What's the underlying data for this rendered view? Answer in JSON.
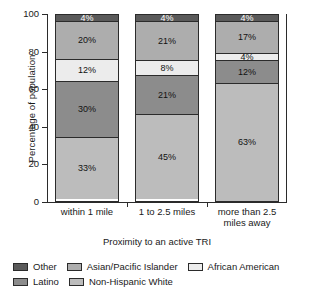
{
  "chart_data": {
    "type": "bar",
    "subtype": "stacked-bar-100-percent",
    "title": "",
    "xlabel": "Proximity to an active TRI",
    "ylabel": "Percentage of population",
    "ylim": [
      0,
      100
    ],
    "yticks": [
      0,
      20,
      40,
      60,
      80,
      100
    ],
    "ytick_labels": [
      "0",
      "20",
      "40",
      "60",
      "80",
      "100"
    ],
    "grid": false,
    "legend_position": "bottom",
    "categories": [
      "within 1 mile",
      "1 to 2.5 miles",
      "more than 2.5 miles away"
    ],
    "stack_order_bottom_to_top": [
      "Non-Hispanic White",
      "Latino",
      "African American",
      "Asian/Pacific Islander",
      "Other"
    ],
    "series": [
      {
        "name": "Non-Hispanic White",
        "color": "#bcbcbc",
        "values": [
          33,
          45,
          63
        ],
        "labels": [
          "33%",
          "45%",
          "63%"
        ]
      },
      {
        "name": "Latino",
        "color": "#8c8c8c",
        "values": [
          30,
          21,
          12
        ],
        "labels": [
          "30%",
          "21%",
          "12%"
        ]
      },
      {
        "name": "African American",
        "color": "#ececec",
        "values": [
          12,
          8,
          4
        ],
        "labels": [
          "12%",
          "8%",
          "4%"
        ]
      },
      {
        "name": "Asian/Pacific Islander",
        "color": "#adadad",
        "values": [
          20,
          21,
          17
        ],
        "labels": [
          "20%",
          "21%",
          "17%"
        ]
      },
      {
        "name": "Other",
        "color": "#5a5a5a",
        "values": [
          4,
          4,
          4
        ],
        "labels": [
          "4%",
          "4%",
          "4%"
        ]
      }
    ],
    "legend_entries": [
      {
        "label": "Other",
        "color": "#5a5a5a"
      },
      {
        "label": "Asian/Pacific Islander",
        "color": "#adadad"
      },
      {
        "label": "African American",
        "color": "#ececec"
      },
      {
        "label": "Latino",
        "color": "#8c8c8c"
      },
      {
        "label": "Non-Hispanic White",
        "color": "#bcbcbc"
      }
    ]
  },
  "axes": {
    "y_title": "Percentage of population",
    "x_title": "Proximity to an active TRI",
    "y_ticks": [
      "100",
      "80",
      "60",
      "40",
      "20",
      "0"
    ],
    "x_tick_labels": [
      {
        "line1": "within 1 mile",
        "line2": ""
      },
      {
        "line1": "1 to 2.5 miles",
        "line2": ""
      },
      {
        "line1": "more than 2.5",
        "line2": "miles away"
      }
    ]
  },
  "bars": [
    {
      "name": "within 1 mile",
      "segments": [
        {
          "label": "4%",
          "value": 4,
          "series": "Other"
        },
        {
          "label": "20%",
          "value": 20,
          "series": "Asian/Pacific Islander"
        },
        {
          "label": "12%",
          "value": 12,
          "series": "African American"
        },
        {
          "label": "30%",
          "value": 30,
          "series": "Latino"
        },
        {
          "label": "33%",
          "value": 33,
          "series": "Non-Hispanic White"
        }
      ]
    },
    {
      "name": "1 to 2.5 miles",
      "segments": [
        {
          "label": "4%",
          "value": 4,
          "series": "Other"
        },
        {
          "label": "21%",
          "value": 21,
          "series": "Asian/Pacific Islander"
        },
        {
          "label": "8%",
          "value": 8,
          "series": "African American"
        },
        {
          "label": "21%",
          "value": 21,
          "series": "Latino"
        },
        {
          "label": "45%",
          "value": 45,
          "series": "Non-Hispanic White"
        }
      ]
    },
    {
      "name": "more than 2.5 miles away",
      "segments": [
        {
          "label": "4%",
          "value": 4,
          "series": "Other"
        },
        {
          "label": "17%",
          "value": 17,
          "series": "Asian/Pacific Islander"
        },
        {
          "label": "4%",
          "value": 4,
          "series": "African American"
        },
        {
          "label": "12%",
          "value": 12,
          "series": "Latino"
        },
        {
          "label": "63%",
          "value": 63,
          "series": "Non-Hispanic White"
        }
      ]
    }
  ],
  "legend": {
    "row1": [
      "Other",
      "Asian/Pacific Islander",
      "African American"
    ],
    "row2": [
      "Latino",
      "Non-Hispanic White"
    ]
  }
}
